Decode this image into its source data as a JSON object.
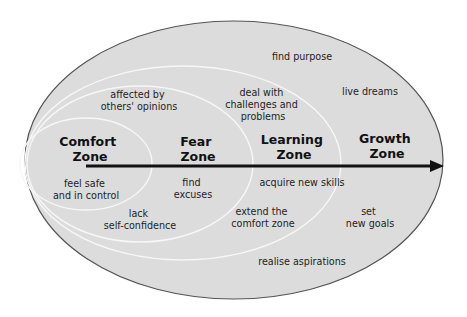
{
  "colors": {
    "background": "#ffffff",
    "ellipse_fill": "#dcdcdc",
    "outer_stroke": "#555555",
    "inner_stroke": "#f7f7f7",
    "arrow": "#111111",
    "text": "#1e1e1e"
  },
  "zones": [
    {
      "name": "comfort",
      "title": [
        "Comfort",
        "Zone"
      ]
    },
    {
      "name": "fear",
      "title": [
        "Fear",
        "Zone"
      ]
    },
    {
      "name": "learning",
      "title": [
        "Learning",
        "Zone"
      ]
    },
    {
      "name": "growth",
      "title": [
        "Growth",
        "Zone"
      ]
    }
  ],
  "labels": {
    "comfort": {
      "feel_safe": [
        "feel safe",
        "and in control"
      ]
    },
    "fear": {
      "affected": [
        "affected by",
        "others' opinions"
      ],
      "find_excuses": [
        "find",
        "excuses"
      ],
      "lack_confidence": [
        "lack",
        "self-confidence"
      ]
    },
    "learning": {
      "deal_with": [
        "deal with",
        "challenges and",
        "problems"
      ],
      "acquire": [
        "acquire new skills"
      ],
      "extend": [
        "extend the",
        "comfort zone"
      ]
    },
    "growth": {
      "find_purpose": [
        "find purpose"
      ],
      "live_dreams": [
        "live dreams"
      ],
      "set_goals": [
        "set",
        "new goals"
      ],
      "realise": [
        "realise aspirations"
      ]
    }
  },
  "arrow": {
    "direction": "right",
    "meaning": "progression through zones"
  }
}
